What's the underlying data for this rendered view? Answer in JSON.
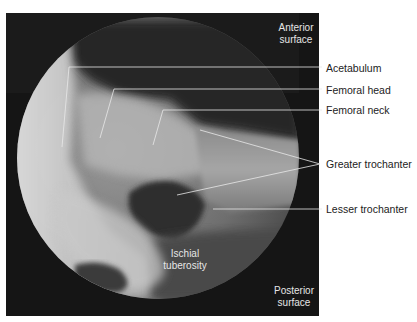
{
  "figure": {
    "type": "radiograph",
    "orientation_labels": {
      "top_right": [
        "Anterior",
        "surface"
      ],
      "bottom_right": [
        "Posterior",
        "surface"
      ]
    },
    "internal_labels": {
      "ischial": [
        "Ischial",
        "tuberosity"
      ]
    },
    "callouts": [
      {
        "label": "Acetabulum"
      },
      {
        "label": "Femoral head"
      },
      {
        "label": "Femoral neck"
      },
      {
        "label": "Greater trochanter"
      },
      {
        "label": "Lesser trochanter"
      }
    ],
    "colors": {
      "frame": "#1a1a1a",
      "leader_line": "#e8e8e8",
      "label_text": "#222222",
      "background": "#ffffff"
    }
  }
}
